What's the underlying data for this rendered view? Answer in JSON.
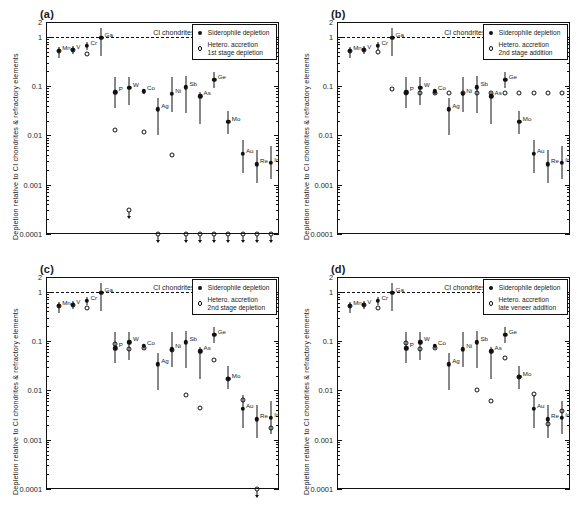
{
  "figure": {
    "axis": {
      "ylabel": "Depletion relative to CI chondrites & refractory elements",
      "yticks": [
        "2",
        "1",
        "0.1",
        "0.01",
        "0.001",
        "0.0001"
      ],
      "ytick_values": [
        2,
        1,
        0.1,
        0.01,
        0.001,
        0.0001
      ],
      "ylim": [
        0.0001,
        2
      ],
      "yscale": "log",
      "reference_line_label": "CI chondrites",
      "reference_line_value": 1
    },
    "legend_common": {
      "filled_label": "Siderophile depletion",
      "open_marker_name": "open-circle"
    },
    "elements": [
      "Mn",
      "V",
      "Cr",
      "Ga",
      "P",
      "W",
      "Co",
      "Ag",
      "Ni",
      "Sb",
      "As",
      "Ge",
      "Mo",
      "Au",
      "Re",
      "Ir"
    ]
  },
  "chart_data": [
    {
      "type": "scatter",
      "panel": "a",
      "tag": "(a)",
      "title": "",
      "xlabel": "",
      "ylabel": "Depletion relative to CI chondrites & refractory elements",
      "ylim": [
        0.0001,
        2
      ],
      "yscale": "log",
      "grid": false,
      "legend_position": "top-right",
      "legend": {
        "filled": "Siderophile depletion",
        "open": "Hetero. accretion\n1st stage depletion"
      },
      "categories": [
        "Mn",
        "V",
        "Cr",
        "Ga",
        "P",
        "W",
        "Co",
        "Ag",
        "Ni",
        "Sb",
        "As",
        "Ge",
        "Mo",
        "Au",
        "Re",
        "Ir"
      ],
      "series": [
        {
          "name": "Siderophile depletion",
          "marker": "filled-circle",
          "values": [
            0.52,
            0.55,
            0.66,
            0.95,
            0.075,
            0.093,
            0.078,
            0.034,
            0.07,
            0.095,
            0.062,
            0.135,
            0.019,
            0.0042,
            0.0026,
            0.0028
          ],
          "err_low": [
            0.37,
            0.45,
            0.55,
            0.4,
            0.036,
            0.042,
            0.07,
            0.01,
            0.03,
            0.028,
            0.017,
            0.09,
            0.0105,
            0.0017,
            0.0011,
            0.0013
          ],
          "err_high": [
            0.62,
            0.66,
            0.8,
            1.5,
            0.155,
            0.15,
            0.086,
            0.058,
            0.155,
            0.16,
            0.077,
            0.195,
            0.031,
            0.0082,
            0.005,
            0.0062
          ]
        },
        {
          "name": "Hetero. accretion 1st stage depletion",
          "marker": "open-circle",
          "values": [
            0.52,
            0.55,
            0.45,
            null,
            0.013,
            null,
            0.012,
            null,
            0.004,
            null,
            null,
            null,
            null,
            null,
            null,
            null
          ],
          "limits": [
            null,
            null,
            null,
            null,
            null,
            0.0003,
            null,
            0.0001,
            null,
            0.0001,
            0.0001,
            0.0001,
            0.0001,
            0.0001,
            0.0001,
            0.0001
          ],
          "limit_type": "upper"
        }
      ]
    },
    {
      "type": "scatter",
      "panel": "b",
      "tag": "(b)",
      "title": "",
      "xlabel": "",
      "ylabel": "Depletion relative to CI chondrites & refractory elements",
      "ylim": [
        0.0001,
        2
      ],
      "yscale": "log",
      "grid": false,
      "legend_position": "top-right",
      "legend": {
        "filled": "Siderophile depletion",
        "open": "Hetero. accretion\n2nd stage addition"
      },
      "categories": [
        "Mn",
        "V",
        "Cr",
        "Ga",
        "P",
        "W",
        "Co",
        "Ag",
        "Ni",
        "Sb",
        "As",
        "Ge",
        "Mo",
        "Au",
        "Re",
        "Ir"
      ],
      "series": [
        {
          "name": "Siderophile depletion",
          "marker": "filled-circle",
          "values": [
            0.52,
            0.55,
            0.66,
            0.95,
            0.075,
            0.093,
            0.078,
            0.034,
            0.07,
            0.095,
            0.062,
            0.135,
            0.019,
            0.0042,
            0.0026,
            0.0028
          ],
          "err_low": [
            0.37,
            0.45,
            0.55,
            0.4,
            0.036,
            0.042,
            0.07,
            0.01,
            0.03,
            0.028,
            0.017,
            0.09,
            0.0105,
            0.0017,
            0.0011,
            0.0013
          ],
          "err_high": [
            0.62,
            0.66,
            0.8,
            1.5,
            0.155,
            0.15,
            0.086,
            0.058,
            0.155,
            0.16,
            0.077,
            0.195,
            0.031,
            0.0082,
            0.005,
            0.0062
          ]
        },
        {
          "name": "Hetero. accretion 2nd stage addition",
          "marker": "open-circle",
          "values": [
            0.52,
            0.55,
            0.5,
            0.088,
            0.073,
            0.072,
            0.072,
            0.072,
            0.072,
            0.072,
            0.072,
            0.072,
            0.072,
            0.072,
            0.072,
            0.072
          ],
          "limits": [
            null,
            null,
            null,
            null,
            null,
            null,
            null,
            null,
            null,
            null,
            null,
            null,
            null,
            null,
            null,
            null
          ],
          "limit_type": null
        }
      ]
    },
    {
      "type": "scatter",
      "panel": "c",
      "tag": "(c)",
      "title": "",
      "xlabel": "",
      "ylabel": "Depletion relative to CI chondrites & refractory elements",
      "ylim": [
        0.0001,
        2
      ],
      "yscale": "log",
      "grid": false,
      "legend_position": "top-right",
      "legend": {
        "filled": "Siderophile depletion",
        "open": "Hetero. accretion\n2nd stage depletion"
      },
      "categories": [
        "Mn",
        "V",
        "Cr",
        "Ga",
        "P",
        "W",
        "Co",
        "Ag",
        "Ni",
        "Sb",
        "As",
        "Ge",
        "Mo",
        "Au",
        "Re",
        "Ir"
      ],
      "series": [
        {
          "name": "Siderophile depletion",
          "marker": "filled-circle",
          "values": [
            0.52,
            0.55,
            0.66,
            0.95,
            0.072,
            0.095,
            0.08,
            0.034,
            0.068,
            0.095,
            0.062,
            0.135,
            0.017,
            0.0042,
            0.0026,
            0.0028
          ],
          "err_low": [
            0.37,
            0.45,
            0.55,
            0.4,
            0.036,
            0.042,
            0.07,
            0.01,
            0.03,
            0.028,
            0.017,
            0.09,
            0.0105,
            0.0017,
            0.0011,
            0.0013
          ],
          "err_high": [
            0.62,
            0.66,
            0.8,
            1.5,
            0.155,
            0.15,
            0.086,
            0.058,
            0.155,
            0.16,
            0.077,
            0.195,
            0.031,
            0.0082,
            0.005,
            0.0062
          ]
        },
        {
          "name": "Hetero. accretion 2nd stage depletion",
          "marker": "open-circle",
          "values": [
            0.52,
            0.55,
            0.48,
            null,
            0.086,
            0.068,
            0.074,
            null,
            0.066,
            0.008,
            0.0043,
            0.041,
            0.017,
            0.0065,
            null,
            0.0017
          ],
          "limits": [
            null,
            null,
            null,
            null,
            null,
            null,
            null,
            null,
            null,
            null,
            null,
            null,
            null,
            null,
            0.0001,
            null
          ],
          "limit_type": "upper"
        }
      ]
    },
    {
      "type": "scatter",
      "panel": "d",
      "tag": "(d)",
      "title": "",
      "xlabel": "",
      "ylabel": "Depletion relative to CI chondrites & refractory elements",
      "ylim": [
        0.0001,
        2
      ],
      "yscale": "log",
      "grid": false,
      "legend_position": "top-right",
      "legend": {
        "filled": "Siderophile depletion",
        "open": "Hetero. accretion\nlate veneer addition"
      },
      "categories": [
        "Mn",
        "V",
        "Cr",
        "Ga",
        "P",
        "W",
        "Co",
        "Ag",
        "Ni",
        "Sb",
        "As",
        "Ge",
        "Mo",
        "Au",
        "Re",
        "Ir"
      ],
      "series": [
        {
          "name": "Siderophile depletion",
          "marker": "filled-circle",
          "values": [
            0.52,
            0.55,
            0.66,
            0.95,
            0.072,
            0.095,
            0.08,
            0.034,
            0.068,
            0.095,
            0.062,
            0.135,
            0.019,
            0.0042,
            0.0026,
            0.0028
          ],
          "err_low": [
            0.37,
            0.45,
            0.55,
            0.4,
            0.036,
            0.042,
            0.07,
            0.01,
            0.03,
            0.028,
            0.017,
            0.09,
            0.0105,
            0.0017,
            0.0011,
            0.0013
          ],
          "err_high": [
            0.62,
            0.66,
            0.8,
            1.5,
            0.155,
            0.15,
            0.086,
            0.058,
            0.155,
            0.16,
            0.077,
            0.195,
            0.031,
            0.0082,
            0.005,
            0.0062
          ]
        },
        {
          "name": "Hetero. accretion late veneer addition",
          "marker": "open-circle",
          "values": [
            0.52,
            0.55,
            0.48,
            null,
            0.09,
            0.068,
            0.074,
            null,
            null,
            0.0103,
            0.0062,
            0.045,
            0.019,
            0.0086,
            0.0021,
            0.0038
          ],
          "limits": [
            null,
            null,
            null,
            null,
            null,
            null,
            null,
            null,
            null,
            null,
            null,
            null,
            null,
            null,
            null,
            null
          ],
          "limit_type": null
        }
      ]
    }
  ]
}
